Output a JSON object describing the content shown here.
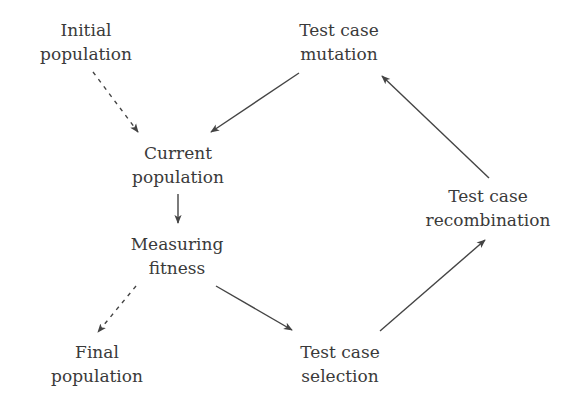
{
  "diagram": {
    "type": "flow-cycle",
    "colors": {
      "text": "#3a3a3a",
      "arrow": "#444444",
      "background": "#ffffff"
    },
    "nodes": {
      "initial": {
        "line1": "Initial",
        "line2": "population"
      },
      "mutation": {
        "line1": "Test case",
        "line2": "mutation"
      },
      "current": {
        "line1": "Current",
        "line2": "population"
      },
      "recombination": {
        "line1": "Test case",
        "line2": "recombination"
      },
      "fitness": {
        "line1": "Measuring",
        "line2": "fitness"
      },
      "final": {
        "line1": "Final",
        "line2": "population"
      },
      "selection": {
        "line1": "Test case",
        "line2": "selection"
      }
    },
    "edges": [
      {
        "from": "Initial population",
        "to": "Current population",
        "style": "dashed"
      },
      {
        "from": "Test case mutation",
        "to": "Current population",
        "style": "solid"
      },
      {
        "from": "Current population",
        "to": "Measuring fitness",
        "style": "solid"
      },
      {
        "from": "Measuring fitness",
        "to": "Final population",
        "style": "dashed"
      },
      {
        "from": "Measuring fitness",
        "to": "Test case selection",
        "style": "solid"
      },
      {
        "from": "Test case selection",
        "to": "Test case recombination",
        "style": "solid"
      },
      {
        "from": "Test case recombination",
        "to": "Test case mutation",
        "style": "solid"
      }
    ]
  }
}
